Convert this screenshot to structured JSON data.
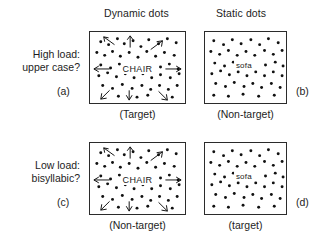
{
  "figure": {
    "column_headers": [
      {
        "key": "dynamic",
        "label": "Dynamic dots"
      },
      {
        "key": "static",
        "label": "Static dots"
      }
    ],
    "row_labels": [
      {
        "key": "high",
        "line1": "High load:",
        "line2": "upper case?"
      },
      {
        "key": "low",
        "line1": "Low load:",
        "line2": "bisyllabic?"
      }
    ],
    "panels": {
      "a": {
        "letter": "(a)",
        "word": "CHAIR",
        "word_case": "upper",
        "caption": "(Target)",
        "dots_type": "dynamic",
        "dot_color": "#111111",
        "border_color": "#2b2b2b"
      },
      "b": {
        "letter": "(b)",
        "word": "sofa",
        "word_case": "lower",
        "caption": "(Non-target)",
        "dots_type": "static",
        "dot_color": "#111111",
        "border_color": "#2b2b2b"
      },
      "c": {
        "letter": "(c)",
        "word": "CHAIR",
        "word_case": "upper",
        "caption": "(Non-target)",
        "dots_type": "dynamic",
        "dot_color": "#111111",
        "border_color": "#2b2b2b"
      },
      "d": {
        "letter": "(d)",
        "word": "sofa",
        "word_case": "lower",
        "caption": "(target)",
        "dots_type": "static",
        "dot_color": "#111111",
        "border_color": "#2b2b2b"
      }
    },
    "motion_arrow_directions": [
      "up-left",
      "up",
      "up-right",
      "left",
      "right",
      "down-left",
      "down",
      "down-right"
    ],
    "background_color": "#ffffff",
    "text_color": "#1d1d1d"
  }
}
